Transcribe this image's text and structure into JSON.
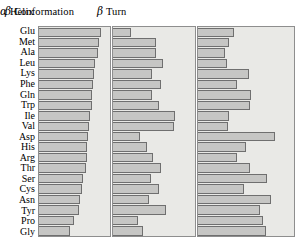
{
  "figure": {
    "background_color": "#ffffff",
    "panel_background_color": "#e9e9e6",
    "bar_fill_color": "#c6c6c4",
    "bar_border_color": "#6f6f6f",
    "panel_border_color": "#8e8e8e"
  },
  "headers": {
    "helix_greek": "α",
    "helix_text": " Helix",
    "beta_greek": "β",
    "beta_text": " Conformation",
    "turn_greek": "β",
    "turn_text": " Turn"
  },
  "labels": [
    "Glu",
    "Met",
    "Ala",
    "Leu",
    "Lys",
    "Phe",
    "Gln",
    "Trp",
    "Ile",
    "Val",
    "Asp",
    "His",
    "Arg",
    "Thr",
    "Ser",
    "Cys",
    "Asn",
    "Tyr",
    "Pro",
    "Gly"
  ],
  "chart_data": {
    "type": "bar",
    "orientation": "horizontal",
    "grid": false,
    "legend": "none",
    "xlabel": "",
    "ylabel": "",
    "categories": [
      "Glu",
      "Met",
      "Ala",
      "Leu",
      "Lys",
      "Phe",
      "Gln",
      "Trp",
      "Ile",
      "Val",
      "Asp",
      "His",
      "Arg",
      "Thr",
      "Ser",
      "Cys",
      "Asn",
      "Tyr",
      "Pro",
      "Gly"
    ],
    "panels": [
      {
        "name": "alpha-helix",
        "title": "α Helix",
        "xlim": [
          0,
          100
        ],
        "values": [
          88,
          85,
          83,
          79,
          77,
          76,
          75,
          74,
          72,
          71,
          69,
          68,
          67,
          66,
          62,
          60,
          58,
          56,
          49,
          44
        ]
      },
      {
        "name": "beta-conformation",
        "title": "β Conformation",
        "xlim": [
          0,
          100
        ],
        "values": [
          22,
          52,
          52,
          61,
          48,
          59,
          47,
          56,
          76,
          74,
          33,
          42,
          49,
          58,
          46,
          56,
          44,
          65,
          31,
          36
        ]
      },
      {
        "name": "beta-turn",
        "title": "β Turn",
        "xlim": [
          0,
          100
        ],
        "values": [
          37,
          32,
          28,
          30,
          53,
          41,
          55,
          54,
          32,
          31,
          80,
          50,
          41,
          54,
          72,
          48,
          76,
          65,
          68,
          71
        ]
      }
    ]
  }
}
